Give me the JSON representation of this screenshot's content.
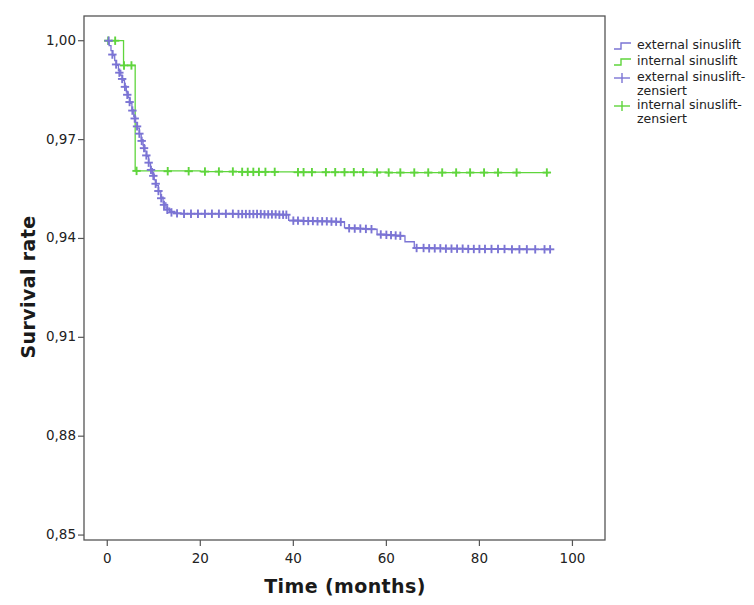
{
  "chart_data": {
    "type": "line",
    "subtype": "kaplan-meier-survival",
    "title": "",
    "xlabel": "Time (months)",
    "ylabel": "Survival rate",
    "xlim": [
      -5,
      107
    ],
    "ylim": [
      0.8485,
      1.0075
    ],
    "xticks": [
      0,
      20,
      40,
      60,
      80,
      100
    ],
    "xtick_labels": [
      "0",
      "20",
      "40",
      "60",
      "80",
      "100"
    ],
    "yticks": [
      0.85,
      0.88,
      0.91,
      0.94,
      0.97,
      1.0
    ],
    "ytick_labels": [
      "0,85",
      "0,88",
      "0,91",
      "0,94",
      "0,97",
      "1,00"
    ],
    "grid": false,
    "legend_position": "right",
    "series": [
      {
        "name": "external sinuslift",
        "color": "#7b74d4",
        "type": "step",
        "points": [
          [
            0.0,
            1.0
          ],
          [
            0.4,
            0.9985
          ],
          [
            0.8,
            0.997
          ],
          [
            1.2,
            0.9955
          ],
          [
            1.6,
            0.994
          ],
          [
            2.0,
            0.9925
          ],
          [
            2.4,
            0.991
          ],
          [
            2.9,
            0.9895
          ],
          [
            3.3,
            0.988
          ],
          [
            3.7,
            0.9862
          ],
          [
            4.1,
            0.9845
          ],
          [
            4.5,
            0.9828
          ],
          [
            4.9,
            0.981
          ],
          [
            5.3,
            0.979
          ],
          [
            5.7,
            0.977
          ],
          [
            6.1,
            0.9752
          ],
          [
            6.5,
            0.9735
          ],
          [
            6.9,
            0.9718
          ],
          [
            7.3,
            0.97
          ],
          [
            7.7,
            0.9682
          ],
          [
            8.1,
            0.9665
          ],
          [
            8.5,
            0.9648
          ],
          [
            8.9,
            0.963
          ],
          [
            9.3,
            0.9612
          ],
          [
            9.7,
            0.9595
          ],
          [
            10.1,
            0.9578
          ],
          [
            10.5,
            0.956
          ],
          [
            11.0,
            0.9542
          ],
          [
            11.5,
            0.9525
          ],
          [
            12.0,
            0.9508
          ],
          [
            12.6,
            0.9492
          ],
          [
            13.4,
            0.9482
          ],
          [
            14.5,
            0.9477
          ],
          [
            16.0,
            0.9475
          ],
          [
            20.0,
            0.9475
          ],
          [
            25.0,
            0.9475
          ],
          [
            30.0,
            0.9474
          ],
          [
            34.0,
            0.9473
          ],
          [
            38.0,
            0.9472
          ],
          [
            39.0,
            0.9455
          ],
          [
            42.0,
            0.9453
          ],
          [
            46.0,
            0.9452
          ],
          [
            49.0,
            0.9451
          ],
          [
            50.0,
            0.945
          ],
          [
            51.0,
            0.9432
          ],
          [
            54.0,
            0.943
          ],
          [
            56.0,
            0.9428
          ],
          [
            58.0,
            0.9412
          ],
          [
            60.0,
            0.941
          ],
          [
            62.0,
            0.9408
          ],
          [
            64.0,
            0.939
          ],
          [
            66.0,
            0.9372
          ],
          [
            70.0,
            0.937
          ],
          [
            75.0,
            0.9369
          ],
          [
            80.0,
            0.9368
          ],
          [
            85.0,
            0.9368
          ],
          [
            90.0,
            0.9367
          ],
          [
            95.0,
            0.9367
          ]
        ],
        "censored": [
          [
            0.3,
            1.0
          ],
          [
            1.1,
            0.9958
          ],
          [
            1.9,
            0.9928
          ],
          [
            2.6,
            0.9903
          ],
          [
            3.2,
            0.9884
          ],
          [
            3.8,
            0.986
          ],
          [
            4.3,
            0.9836
          ],
          [
            4.8,
            0.9814
          ],
          [
            5.4,
            0.9788
          ],
          [
            5.9,
            0.9764
          ],
          [
            6.4,
            0.974
          ],
          [
            6.9,
            0.9718
          ],
          [
            7.4,
            0.9696
          ],
          [
            7.9,
            0.9674
          ],
          [
            8.4,
            0.9652
          ],
          [
            8.9,
            0.963
          ],
          [
            9.4,
            0.9608
          ],
          [
            9.9,
            0.959
          ],
          [
            10.4,
            0.9566
          ],
          [
            11.0,
            0.9544
          ],
          [
            11.6,
            0.9522
          ],
          [
            12.2,
            0.9502
          ],
          [
            12.9,
            0.9487
          ],
          [
            13.8,
            0.9479
          ],
          [
            15.0,
            0.9476
          ],
          [
            16.5,
            0.9475
          ],
          [
            18.0,
            0.9475
          ],
          [
            19.5,
            0.9475
          ],
          [
            21.0,
            0.9475
          ],
          [
            22.5,
            0.9475
          ],
          [
            24.0,
            0.9475
          ],
          [
            25.5,
            0.9475
          ],
          [
            27.0,
            0.9475
          ],
          [
            28.2,
            0.9474
          ],
          [
            29.0,
            0.9474
          ],
          [
            29.8,
            0.9474
          ],
          [
            30.6,
            0.9474
          ],
          [
            31.4,
            0.9474
          ],
          [
            32.2,
            0.9474
          ],
          [
            33.0,
            0.9474
          ],
          [
            33.8,
            0.9473
          ],
          [
            34.6,
            0.9473
          ],
          [
            35.4,
            0.9473
          ],
          [
            36.2,
            0.9473
          ],
          [
            37.0,
            0.9472
          ],
          [
            37.8,
            0.9472
          ],
          [
            38.5,
            0.9472
          ],
          [
            40.0,
            0.9454
          ],
          [
            41.0,
            0.9454
          ],
          [
            42.2,
            0.9453
          ],
          [
            43.2,
            0.9453
          ],
          [
            44.2,
            0.9453
          ],
          [
            45.2,
            0.9452
          ],
          [
            46.2,
            0.9452
          ],
          [
            47.2,
            0.9452
          ],
          [
            48.2,
            0.9451
          ],
          [
            49.2,
            0.9451
          ],
          [
            50.2,
            0.945
          ],
          [
            52.0,
            0.9431
          ],
          [
            53.2,
            0.943
          ],
          [
            54.4,
            0.943
          ],
          [
            55.6,
            0.9429
          ],
          [
            56.8,
            0.9428
          ],
          [
            58.8,
            0.9412
          ],
          [
            60.0,
            0.9411
          ],
          [
            61.0,
            0.941
          ],
          [
            62.0,
            0.9409
          ],
          [
            63.0,
            0.9408
          ],
          [
            66.5,
            0.9371
          ],
          [
            68.0,
            0.9371
          ],
          [
            69.2,
            0.937
          ],
          [
            70.4,
            0.937
          ],
          [
            71.6,
            0.937
          ],
          [
            72.8,
            0.9369
          ],
          [
            74.0,
            0.9369
          ],
          [
            75.2,
            0.9369
          ],
          [
            76.4,
            0.9369
          ],
          [
            77.6,
            0.9368
          ],
          [
            78.8,
            0.9368
          ],
          [
            80.0,
            0.9368
          ],
          [
            81.2,
            0.9368
          ],
          [
            82.6,
            0.9368
          ],
          [
            84.0,
            0.9368
          ],
          [
            85.4,
            0.9368
          ],
          [
            87.0,
            0.9367
          ],
          [
            88.6,
            0.9367
          ],
          [
            90.2,
            0.9367
          ],
          [
            92.0,
            0.9367
          ],
          [
            94.0,
            0.9367
          ],
          [
            95.2,
            0.9367
          ]
        ]
      },
      {
        "name": "internal sinuslift",
        "color": "#5fd53c",
        "type": "step",
        "points": [
          [
            0.0,
            1.0
          ],
          [
            2.0,
            1.0
          ],
          [
            3.5,
            0.9925
          ],
          [
            6.0,
            0.9925
          ],
          [
            6.0,
            0.9605
          ],
          [
            10.0,
            0.9605
          ],
          [
            20.0,
            0.9603
          ],
          [
            30.0,
            0.9602
          ],
          [
            40.0,
            0.9601
          ],
          [
            50.0,
            0.9601
          ],
          [
            60.0,
            0.96
          ],
          [
            70.0,
            0.96
          ],
          [
            80.0,
            0.96
          ],
          [
            90.0,
            0.96
          ],
          [
            95.0,
            0.96
          ]
        ],
        "censored": [
          [
            0.2,
            1.0
          ],
          [
            1.7,
            1.0
          ],
          [
            3.6,
            0.9925
          ],
          [
            5.2,
            0.9925
          ],
          [
            6.3,
            0.9605
          ],
          [
            13.0,
            0.9604
          ],
          [
            17.5,
            0.9604
          ],
          [
            21.0,
            0.9603
          ],
          [
            24.0,
            0.9603
          ],
          [
            27.0,
            0.9603
          ],
          [
            29.0,
            0.9602
          ],
          [
            30.2,
            0.9602
          ],
          [
            31.4,
            0.9602
          ],
          [
            32.6,
            0.9602
          ],
          [
            34.0,
            0.9602
          ],
          [
            36.0,
            0.9602
          ],
          [
            41.0,
            0.9601
          ],
          [
            42.2,
            0.9601
          ],
          [
            44.0,
            0.9601
          ],
          [
            47.0,
            0.9601
          ],
          [
            49.0,
            0.9601
          ],
          [
            51.0,
            0.9601
          ],
          [
            53.0,
            0.9601
          ],
          [
            55.0,
            0.9601
          ],
          [
            58.0,
            0.96
          ],
          [
            60.5,
            0.96
          ],
          [
            63.0,
            0.96
          ],
          [
            66.0,
            0.96
          ],
          [
            69.0,
            0.96
          ],
          [
            72.0,
            0.96
          ],
          [
            75.0,
            0.96
          ],
          [
            78.0,
            0.96
          ],
          [
            81.0,
            0.96
          ],
          [
            84.0,
            0.96
          ],
          [
            88.0,
            0.96
          ],
          [
            94.5,
            0.96
          ]
        ]
      }
    ],
    "legend_entries": [
      {
        "label": "external sinuslift",
        "color": "#7b74d4",
        "marker": "step-line"
      },
      {
        "label": "internal sinuslift",
        "color": "#5fd53c",
        "marker": "step-line"
      },
      {
        "label": "external sinuslift-\nzensiert",
        "color": "#7b74d4",
        "marker": "plus"
      },
      {
        "label": "internal sinuslift-\nzensiert",
        "color": "#5fd53c",
        "marker": "plus"
      }
    ]
  },
  "colors": {
    "external": "#7b74d4",
    "internal": "#5fd53c",
    "axis": "#555555",
    "text": "#222222"
  }
}
